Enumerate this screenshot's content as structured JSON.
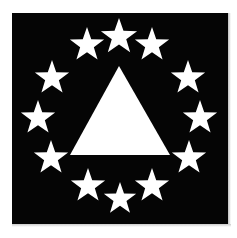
{
  "image": {
    "title": "Thirteen-star flag emblem",
    "width": 237,
    "height": 238,
    "background_color": "#ffffff"
  },
  "flag": {
    "field_color": "#050505",
    "emblem_color": "#ffffff",
    "field": {
      "x": 12,
      "y": 13,
      "width": 216,
      "height": 211
    },
    "description": "White triangle centered on a black square field, encircled by thirteen white five-pointed stars"
  },
  "triangle": {
    "name": "pyramid",
    "fill": "#ffffff",
    "apex": {
      "x": 119,
      "y": 66
    },
    "base_left": {
      "x": 70,
      "y": 155
    },
    "base_right": {
      "x": 170,
      "y": 155
    },
    "points": "119,66 170,155 70,155"
  },
  "stars": {
    "count": 13,
    "points_per_star": 5,
    "fill": "#ffffff",
    "circle_center": {
      "x": 119,
      "y": 118
    },
    "circle_radius": 82,
    "items": [
      {
        "label": "star-1",
        "cx": 119,
        "cy": 37,
        "r": 19,
        "rot": 0
      },
      {
        "label": "star-2",
        "cx": 87,
        "cy": 45,
        "r": 18,
        "rot": 0
      },
      {
        "label": "star-3",
        "cx": 152,
        "cy": 45,
        "r": 18,
        "rot": 0
      },
      {
        "label": "star-4",
        "cx": 52,
        "cy": 78,
        "r": 18,
        "rot": 0
      },
      {
        "label": "star-5",
        "cx": 188,
        "cy": 78,
        "r": 18,
        "rot": 0
      },
      {
        "label": "star-6",
        "cx": 38,
        "cy": 118,
        "r": 18,
        "rot": 0
      },
      {
        "label": "star-7",
        "cx": 200,
        "cy": 118,
        "r": 18,
        "rot": 0
      },
      {
        "label": "star-8",
        "cx": 51,
        "cy": 158,
        "r": 18,
        "rot": 0
      },
      {
        "label": "star-9",
        "cx": 189,
        "cy": 158,
        "r": 18,
        "rot": 0
      },
      {
        "label": "star-10",
        "cx": 88,
        "cy": 186,
        "r": 18,
        "rot": 0
      },
      {
        "label": "star-11",
        "cx": 152,
        "cy": 186,
        "r": 18,
        "rot": 0
      },
      {
        "label": "star-12",
        "cx": 120,
        "cy": 199,
        "r": 17,
        "rot": 0
      },
      {
        "label": "star-13",
        "cx": 119,
        "cy": 37,
        "r": 0,
        "rot": 0
      }
    ]
  }
}
